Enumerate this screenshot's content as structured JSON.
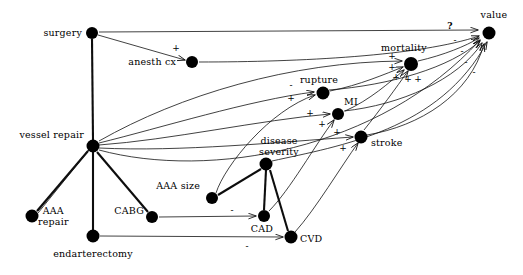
{
  "diagram": {
    "type": "directed-graph",
    "colors": {
      "node": "#000000",
      "edge": "#1a1a1a",
      "background": "#ffffff"
    },
    "nodes": [
      {
        "id": "surgery",
        "label": "surgery",
        "x": 92,
        "y": 33,
        "r": 6.0,
        "label_x": 82,
        "label_y": 33,
        "anchor": "r"
      },
      {
        "id": "anesth_cx",
        "label": "anesth cx",
        "x": 192,
        "y": 62,
        "r": 6.0,
        "label_x": 176,
        "label_y": 62,
        "anchor": "r"
      },
      {
        "id": "value",
        "label": "value",
        "x": 489,
        "y": 33,
        "r": 6.5,
        "label_x": 481,
        "label_y": 17,
        "anchor": "l"
      },
      {
        "id": "mortality",
        "label": "mortality",
        "x": 411,
        "y": 64,
        "r": 7.0,
        "label_x": 400,
        "label_y": 49,
        "anchor": "c"
      },
      {
        "id": "rupture",
        "label": "rupture",
        "x": 323,
        "y": 93,
        "r": 6.5,
        "label_x": 318,
        "label_y": 80,
        "anchor": "c"
      },
      {
        "id": "MI",
        "label": "MI",
        "x": 338,
        "y": 114,
        "r": 6.0,
        "label_x": 349,
        "label_y": 102,
        "anchor": "c"
      },
      {
        "id": "stroke",
        "label": "stroke",
        "x": 361,
        "y": 137,
        "r": 6.5,
        "label_x": 371,
        "label_y": 143,
        "anchor": "l"
      },
      {
        "id": "vessel_repair",
        "label": "vessel repair",
        "x": 93,
        "y": 146,
        "r": 6.5,
        "label_x": 84,
        "label_y": 135,
        "anchor": "r"
      },
      {
        "id": "disease_sev",
        "label": "disease severity",
        "x": 266,
        "y": 164,
        "r": 6.5,
        "label_x": 268,
        "label_y": 147,
        "anchor": "c",
        "two_line": true,
        "line1": "disease",
        "line2": "severity"
      },
      {
        "id": "AAA_size",
        "label": "AAA size",
        "x": 212,
        "y": 198,
        "r": 6.0,
        "label_x": 200,
        "label_y": 186,
        "anchor": "r"
      },
      {
        "id": "CABG",
        "label": "CABG",
        "x": 152,
        "y": 217,
        "r": 6.0,
        "label_x": 143,
        "label_y": 210,
        "anchor": "r"
      },
      {
        "id": "CAD",
        "label": "CAD",
        "x": 264,
        "y": 216,
        "r": 6.0,
        "label_x": 261,
        "label_y": 229,
        "anchor": "c"
      },
      {
        "id": "CVD",
        "label": "CVD",
        "x": 291,
        "y": 237,
        "r": 6.5,
        "label_x": 301,
        "label_y": 238,
        "anchor": "l"
      },
      {
        "id": "AAA_repair",
        "label": "AAA repair",
        "x": 32,
        "y": 216,
        "r": 6.5,
        "label_x": 40,
        "label_y": 214,
        "anchor": "l",
        "two_line": true,
        "line1": "AAA",
        "line2": "repair"
      },
      {
        "id": "endarterectomy",
        "label": "endarterectomy",
        "x": 93,
        "y": 236,
        "r": 6.5,
        "label_x": 93,
        "label_y": 254,
        "anchor": "c"
      }
    ],
    "edge_signs": [
      {
        "for": "surgery->anesth_cx",
        "sign": "+",
        "x": 176,
        "y": 48
      },
      {
        "for": "surgery->value",
        "sign": "?",
        "x": 450,
        "y": 26
      },
      {
        "for": "anesth_cx->value",
        "sign": "-",
        "x": 455,
        "y": 40
      },
      {
        "for": "mortality->value",
        "sign": "-",
        "x": 462,
        "y": 51
      },
      {
        "for": "rupture->value",
        "sign": "-",
        "x": 466,
        "y": 62
      },
      {
        "for": "MI->value",
        "sign": "-",
        "x": 473,
        "y": 71
      },
      {
        "for": "to_mortality_1",
        "sign": "+",
        "x": 392,
        "y": 56
      },
      {
        "for": "to_mortality_2",
        "sign": "+",
        "x": 392,
        "y": 66
      },
      {
        "for": "to_mortality_3",
        "sign": "+",
        "x": 396,
        "y": 76
      },
      {
        "for": "to_mortality_4",
        "sign": "+",
        "x": 407,
        "y": 79
      },
      {
        "for": "to_mortality_5",
        "sign": "+",
        "x": 417,
        "y": 79
      },
      {
        "for": "to_rupture_minus",
        "sign": "-",
        "x": 291,
        "y": 85
      },
      {
        "for": "to_rupture_plus",
        "sign": "+",
        "x": 291,
        "y": 97
      },
      {
        "for": "to_MI_plus",
        "sign": "+",
        "x": 310,
        "y": 113
      },
      {
        "for": "to_MI_plus2",
        "sign": "+",
        "x": 322,
        "y": 123
      },
      {
        "for": "to_stroke_plus",
        "sign": "+",
        "x": 337,
        "y": 132
      },
      {
        "for": "to_stroke_plus2",
        "sign": "+",
        "x": 343,
        "y": 148
      },
      {
        "for": "CABG->CAD",
        "sign": "-",
        "x": 232,
        "y": 210
      },
      {
        "for": "endarterectomy->CVD",
        "sign": "-",
        "x": 247,
        "y": 245
      }
    ],
    "edges": [
      {
        "from": "surgery",
        "to": "anesth_cx",
        "kind": "straight",
        "arrow": true,
        "weight": "thin"
      },
      {
        "from": "surgery",
        "to": "value",
        "kind": "straight",
        "arrow": true,
        "weight": "thin"
      },
      {
        "from": "surgery",
        "to": "vessel_repair",
        "kind": "straight",
        "arrow": false,
        "weight": "thick"
      },
      {
        "from": "anesth_cx",
        "to": "value",
        "kind": "curve",
        "arrow": true,
        "weight": "thin"
      },
      {
        "from": "mortality",
        "to": "value",
        "kind": "curve",
        "arrow": true,
        "weight": "thin"
      },
      {
        "from": "rupture",
        "to": "mortality",
        "kind": "curve",
        "arrow": true,
        "weight": "thin"
      },
      {
        "from": "MI",
        "to": "mortality",
        "kind": "curve",
        "arrow": true,
        "weight": "thin"
      },
      {
        "from": "stroke",
        "to": "mortality",
        "kind": "curve",
        "arrow": true,
        "weight": "thin"
      },
      {
        "from": "rupture",
        "to": "value",
        "kind": "curve",
        "arrow": true,
        "weight": "thin"
      },
      {
        "from": "MI",
        "to": "value",
        "kind": "curve",
        "arrow": true,
        "weight": "thin"
      },
      {
        "from": "stroke",
        "to": "value",
        "kind": "curve",
        "arrow": true,
        "weight": "thin"
      },
      {
        "from": "vessel_repair",
        "to": "rupture",
        "kind": "curve",
        "arrow": true,
        "weight": "thin"
      },
      {
        "from": "vessel_repair",
        "to": "mortality",
        "kind": "curve",
        "arrow": true,
        "weight": "thin"
      },
      {
        "from": "vessel_repair",
        "to": "AAA_repair",
        "kind": "straight",
        "arrow": false,
        "weight": "thick"
      },
      {
        "from": "vessel_repair",
        "to": "endarterectomy",
        "kind": "straight",
        "arrow": false,
        "weight": "thick"
      },
      {
        "from": "vessel_repair",
        "to": "CABG",
        "kind": "straight",
        "arrow": false,
        "weight": "thick"
      },
      {
        "from": "disease_sev",
        "to": "CAD",
        "kind": "straight",
        "arrow": false,
        "weight": "thick"
      },
      {
        "from": "disease_sev",
        "to": "CVD",
        "kind": "straight",
        "arrow": false,
        "weight": "thick"
      },
      {
        "from": "disease_sev",
        "to": "AAA_size",
        "kind": "curve",
        "arrow": false,
        "weight": "thick"
      },
      {
        "from": "CABG",
        "to": "CAD",
        "kind": "straight",
        "arrow": true,
        "weight": "thin"
      },
      {
        "from": "endarterectomy",
        "to": "CVD",
        "kind": "straight",
        "arrow": true,
        "weight": "thin"
      },
      {
        "from": "AAA_size",
        "to": "rupture",
        "kind": "curve",
        "arrow": true,
        "weight": "thin"
      },
      {
        "from": "CAD",
        "to": "MI",
        "kind": "curve",
        "arrow": true,
        "weight": "thin"
      },
      {
        "from": "CVD",
        "to": "stroke",
        "kind": "curve",
        "arrow": true,
        "weight": "thin"
      },
      {
        "from": "disease_sev",
        "to": "value",
        "kind": "curve",
        "arrow": true,
        "weight": "thin"
      },
      {
        "from": "AAA_repair",
        "to": "vessel_repair",
        "kind": "straight",
        "arrow": false,
        "weight": "thin"
      }
    ]
  }
}
